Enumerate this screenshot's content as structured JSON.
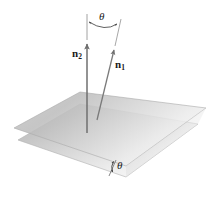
{
  "figure": {
    "type": "geometry-diagram",
    "background_color": "#ffffff",
    "labels": {
      "theta_top": "θ",
      "theta_bottom": "θ",
      "n2_base": "n",
      "n2_sub": "2",
      "n1_base": "n",
      "n1_sub": "1"
    },
    "colors": {
      "plane_fill_dark": "#b8b8b8",
      "plane_fill_light": "#ececec",
      "plane_edge": "#a8a8a8",
      "vector_stroke": "#6b6b6b",
      "arc_stroke": "#5a5a5a",
      "text": "#1a1a1a"
    },
    "elements": {
      "upper_plane_name": "plane-2",
      "lower_plane_name": "plane-1",
      "vector_n2_name": "normal-vector-n2",
      "vector_n1_name": "normal-vector-n1",
      "arc_top_name": "angle-arc-between-normals",
      "arc_bottom_name": "angle-arc-between-planes"
    }
  }
}
